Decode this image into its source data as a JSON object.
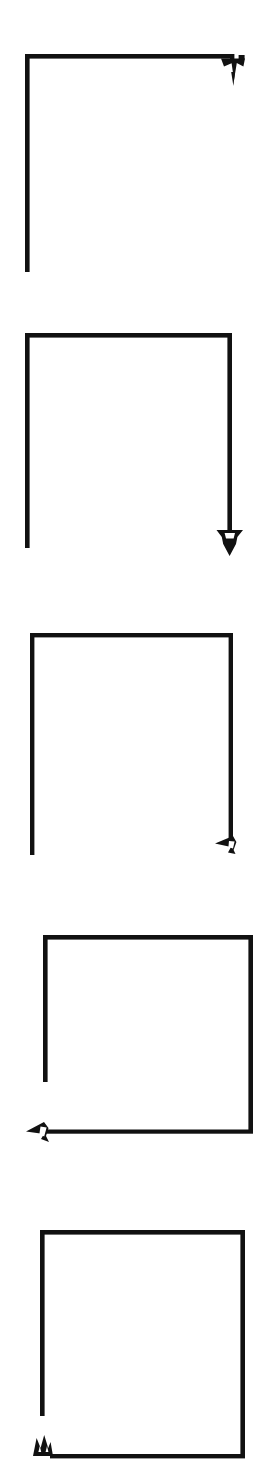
{
  "sheet": {
    "width": 265,
    "height": 1474,
    "background_color": "#ffffff",
    "ink_color": "#111111",
    "header_fragment": "",
    "title": "",
    "caption": ""
  },
  "diagram": {
    "kind": "line-drawing-sequence",
    "stroke_width": 4,
    "panel_count": 5,
    "panels": [
      {
        "index": 1,
        "label": "step-1",
        "box": {
          "x": 25,
          "y": 54,
          "width": 208,
          "height": 218
        },
        "strokes": [
          "left-vertical",
          "top-horizontal"
        ],
        "arrow": {
          "name": "arrowhead-down",
          "direction": "down",
          "position": "top-right",
          "x": 233,
          "y": 58
        }
      },
      {
        "index": 2,
        "label": "step-2",
        "box": {
          "x": 25,
          "y": 333,
          "width": 207,
          "height": 215
        },
        "strokes": [
          "left-vertical",
          "top-horizontal",
          "right-vertical"
        ],
        "arrow": {
          "name": "arrowhead-down",
          "direction": "down",
          "position": "bottom-right",
          "x": 232,
          "y": 540
        }
      },
      {
        "index": 3,
        "label": "step-3",
        "box": {
          "x": 30,
          "y": 633,
          "width": 203,
          "height": 222
        },
        "strokes": [
          "left-vertical",
          "top-horizontal",
          "right-vertical"
        ],
        "arrow": {
          "name": "arrowhead-left",
          "direction": "left",
          "position": "bottom-right",
          "x": 226,
          "y": 843
        }
      },
      {
        "index": 4,
        "label": "step-4",
        "box": {
          "x": 43,
          "y": 935,
          "width": 210,
          "height": 217
        },
        "strokes": [
          "left-vertical",
          "top-horizontal",
          "right-vertical",
          "bottom-horizontal"
        ],
        "arrow": {
          "name": "arrowhead-left",
          "direction": "left",
          "position": "bottom-left",
          "x": 37,
          "y": 1148
        }
      },
      {
        "index": 5,
        "label": "step-5",
        "box": {
          "x": 40,
          "y": 1230,
          "width": 205,
          "height": 228
        },
        "strokes": [
          "left-vertical",
          "top-horizontal",
          "right-vertical",
          "bottom-horizontal"
        ],
        "arrow": {
          "name": "arrowhead-up",
          "direction": "up",
          "position": "bottom-left",
          "x": 43,
          "y": 1446
        }
      }
    ]
  }
}
